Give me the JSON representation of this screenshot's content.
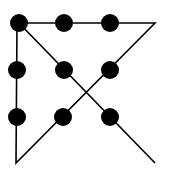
{
  "diagram": {
    "type": "nine-dots-puzzle-solution",
    "colors": {
      "dot": "#000000",
      "line": "#000000",
      "background": "#ffffff"
    },
    "dots": [
      {
        "x": 19,
        "y": 23
      },
      {
        "x": 64,
        "y": 23
      },
      {
        "x": 110,
        "y": 23
      },
      {
        "x": 17,
        "y": 70
      },
      {
        "x": 64,
        "y": 70
      },
      {
        "x": 110,
        "y": 70
      },
      {
        "x": 17,
        "y": 117
      },
      {
        "x": 63,
        "y": 117
      },
      {
        "x": 110,
        "y": 117
      }
    ],
    "path": [
      {
        "x": 155,
        "y": 163
      },
      {
        "x": 19,
        "y": 23
      },
      {
        "x": 155,
        "y": 23
      },
      {
        "x": 16,
        "y": 163
      },
      {
        "x": 17,
        "y": 23
      }
    ]
  }
}
